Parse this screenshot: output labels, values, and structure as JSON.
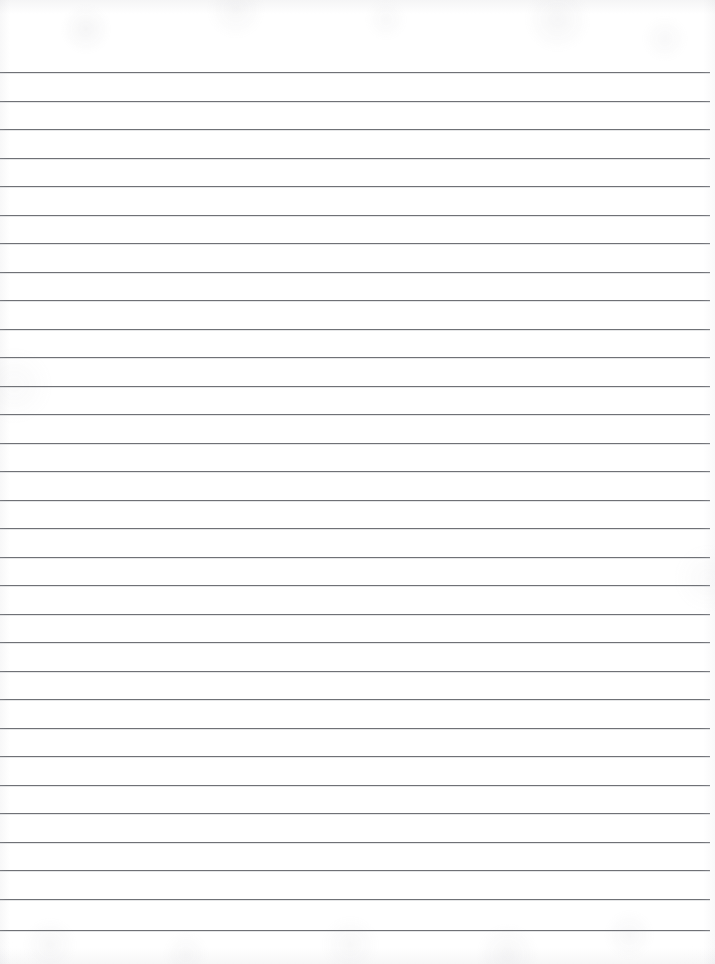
{
  "document": {
    "kind": "scanned-ruled-notebook-page",
    "title": "Blank Lined Paper",
    "content_text": "",
    "is_blank": true,
    "page_width_px": 715,
    "page_height_px": 964,
    "paper_color": "#ffffff",
    "rule_color": "#6f7176",
    "rule_thickness_px": 1,
    "rule_count": 31,
    "first_rule_y_px": 72,
    "rule_spacing_px": 28.6,
    "last_rule_y_px": 930,
    "rule_left_x_px": 0,
    "rule_right_x_px": 710,
    "top_margin_px": 72,
    "bottom_margin_px": 34,
    "right_margin_px": 5,
    "rule_tilt_deg": 0.1
  },
  "rules": [
    {
      "index": 1,
      "y": 72,
      "left": 0,
      "right": 710
    },
    {
      "index": 2,
      "y": 101,
      "left": 0,
      "right": 710
    },
    {
      "index": 3,
      "y": 129,
      "left": 0,
      "right": 710
    },
    {
      "index": 4,
      "y": 158,
      "left": 0,
      "right": 710
    },
    {
      "index": 5,
      "y": 186,
      "left": 0,
      "right": 710
    },
    {
      "index": 6,
      "y": 215,
      "left": 0,
      "right": 710
    },
    {
      "index": 7,
      "y": 243,
      "left": 0,
      "right": 710
    },
    {
      "index": 8,
      "y": 272,
      "left": 0,
      "right": 710
    },
    {
      "index": 9,
      "y": 300,
      "left": 0,
      "right": 710
    },
    {
      "index": 10,
      "y": 329,
      "left": 0,
      "right": 710
    },
    {
      "index": 11,
      "y": 357,
      "left": 0,
      "right": 710
    },
    {
      "index": 12,
      "y": 386,
      "left": 0,
      "right": 710
    },
    {
      "index": 13,
      "y": 414,
      "left": 0,
      "right": 710
    },
    {
      "index": 14,
      "y": 443,
      "left": 0,
      "right": 710
    },
    {
      "index": 15,
      "y": 471,
      "left": 0,
      "right": 710
    },
    {
      "index": 16,
      "y": 500,
      "left": 0,
      "right": 710
    },
    {
      "index": 17,
      "y": 528,
      "left": 0,
      "right": 710
    },
    {
      "index": 18,
      "y": 557,
      "left": 0,
      "right": 710
    },
    {
      "index": 19,
      "y": 585,
      "left": 0,
      "right": 710
    },
    {
      "index": 20,
      "y": 614,
      "left": 0,
      "right": 710
    },
    {
      "index": 21,
      "y": 642,
      "left": 0,
      "right": 710
    },
    {
      "index": 22,
      "y": 671,
      "left": 0,
      "right": 710
    },
    {
      "index": 23,
      "y": 699,
      "left": 0,
      "right": 710
    },
    {
      "index": 24,
      "y": 728,
      "left": 0,
      "right": 710
    },
    {
      "index": 25,
      "y": 756,
      "left": 0,
      "right": 710
    },
    {
      "index": 26,
      "y": 785,
      "left": 0,
      "right": 710
    },
    {
      "index": 27,
      "y": 813,
      "left": 0,
      "right": 710
    },
    {
      "index": 28,
      "y": 842,
      "left": 0,
      "right": 710
    },
    {
      "index": 29,
      "y": 870,
      "left": 0,
      "right": 710
    },
    {
      "index": 30,
      "y": 899,
      "left": 0,
      "right": 710
    },
    {
      "index": 31,
      "y": 930,
      "left": 0,
      "right": 710
    }
  ]
}
